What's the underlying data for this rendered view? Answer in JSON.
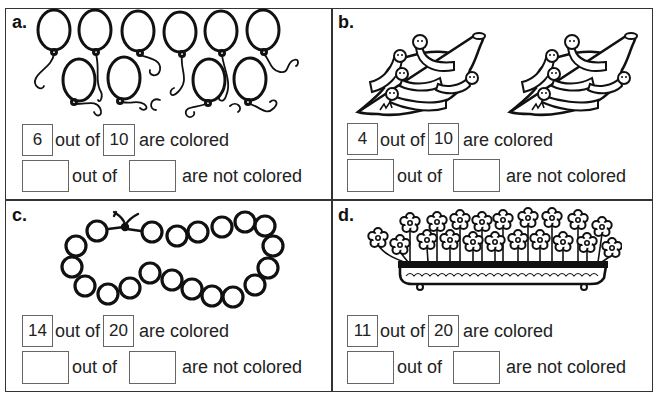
{
  "worksheet": {
    "panels": [
      {
        "letter": "a.",
        "picture": "balloons",
        "item_count": 10,
        "row1": {
          "colored": "6",
          "total": "10",
          "of_label": "out of",
          "suffix": "are colored"
        },
        "row2": {
          "colored": "",
          "total": "",
          "of_label": "out of",
          "suffix": "are not colored"
        }
      },
      {
        "letter": "b.",
        "picture": "caterpillars-on-leaves",
        "item_count": 10,
        "row1": {
          "colored": "4",
          "total": "10",
          "of_label": "out of",
          "suffix": "are colored"
        },
        "row2": {
          "colored": "",
          "total": "",
          "of_label": "out of",
          "suffix": "are not colored"
        }
      },
      {
        "letter": "c.",
        "picture": "bead-necklace",
        "item_count": 20,
        "row1": {
          "colored": "14",
          "total": "20",
          "of_label": "out of",
          "suffix": "are colored"
        },
        "row2": {
          "colored": "",
          "total": "",
          "of_label": "out of",
          "suffix": "are not colored"
        }
      },
      {
        "letter": "d.",
        "picture": "flower-planter",
        "item_count": 20,
        "row1": {
          "colored": "11",
          "total": "20",
          "of_label": "out of",
          "suffix": "are colored"
        },
        "row2": {
          "colored": "",
          "total": "",
          "of_label": "out of",
          "suffix": "are not colored"
        }
      }
    ]
  }
}
